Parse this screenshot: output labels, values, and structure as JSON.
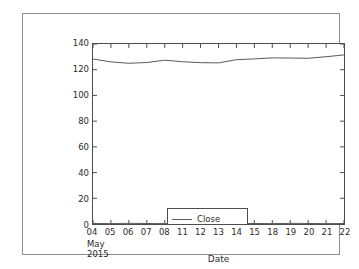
{
  "figure": {
    "background_color": "#ffffff",
    "frame_color": "#8e8e8e",
    "axis_color": "#4d4d4d"
  },
  "chart_data": {
    "type": "line",
    "title": "",
    "xlabel": "Date",
    "ylabel": "",
    "x_offset_text": "May\n2015",
    "categories": [
      "04",
      "05",
      "06",
      "07",
      "08",
      "11",
      "12",
      "13",
      "14",
      "15",
      "18",
      "19",
      "20",
      "21",
      "22"
    ],
    "x_tick_labels": [
      "04",
      "05",
      "06",
      "07",
      "08",
      "11",
      "12",
      "13",
      "14",
      "15",
      "18",
      "19",
      "20",
      "21",
      "22"
    ],
    "y_tick_labels": [
      "0",
      "20",
      "40",
      "60",
      "80",
      "100",
      "120",
      "140"
    ],
    "y_ticks": [
      0,
      20,
      40,
      60,
      80,
      100,
      120,
      140
    ],
    "ylim": [
      0,
      140
    ],
    "xlim": [
      0,
      14
    ],
    "grid": false,
    "legend_position": "lower left",
    "series": [
      {
        "name": "Close",
        "color": "#5a5a5a",
        "values": [
          128.3,
          126.1,
          125.0,
          125.6,
          127.4,
          126.2,
          125.5,
          125.3,
          127.8,
          128.4,
          129.2,
          129.1,
          128.9,
          130.1,
          131.5
        ]
      },
      {
        "name": "sentiment",
        "color": "#5a5a5a",
        "values": [
          0.4,
          0.3,
          0.5,
          0.4,
          0.3,
          0.4,
          0.5,
          0.3,
          0.4,
          0.4,
          0.3,
          0.5,
          0.4,
          0.3,
          0.4
        ]
      }
    ]
  },
  "legend": {
    "entries": [
      {
        "label": "Close"
      },
      {
        "label": "sentiment"
      }
    ]
  }
}
